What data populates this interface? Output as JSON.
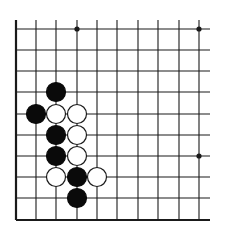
{
  "diagram": {
    "type": "go-board-fragment",
    "colors": {
      "background": "#ffffff",
      "line": "#1a1a1a",
      "black_stone": "#0a0a0a",
      "white_stone_fill": "#ffffff",
      "white_stone_stroke": "#1a1a1a"
    },
    "grid": {
      "columns_x": [
        16,
        36,
        56,
        77,
        97,
        117,
        138,
        158,
        179,
        199
      ],
      "rows_y": [
        29,
        50,
        71,
        92,
        114,
        135,
        156,
        177,
        198,
        220
      ],
      "top_extent": 20,
      "right_extent": 210,
      "left_edge_thick": true,
      "bottom_edge_thick": true
    },
    "star_points": [
      {
        "col": 3,
        "row": 0
      },
      {
        "col": 9,
        "row": 0
      },
      {
        "col": 9,
        "row": 6
      }
    ],
    "stones": [
      {
        "color": "black",
        "col": 2,
        "row": 3
      },
      {
        "color": "black",
        "col": 1,
        "row": 4
      },
      {
        "color": "white",
        "col": 2,
        "row": 4
      },
      {
        "color": "white",
        "col": 3,
        "row": 4
      },
      {
        "color": "black",
        "col": 2,
        "row": 5
      },
      {
        "color": "white",
        "col": 3,
        "row": 5
      },
      {
        "color": "black",
        "col": 2,
        "row": 6
      },
      {
        "color": "white",
        "col": 3,
        "row": 6
      },
      {
        "color": "white",
        "col": 2,
        "row": 7
      },
      {
        "color": "black",
        "col": 3,
        "row": 7
      },
      {
        "color": "white",
        "col": 4,
        "row": 7
      },
      {
        "color": "black",
        "col": 3,
        "row": 8
      }
    ],
    "stone_radius": 9.5
  }
}
